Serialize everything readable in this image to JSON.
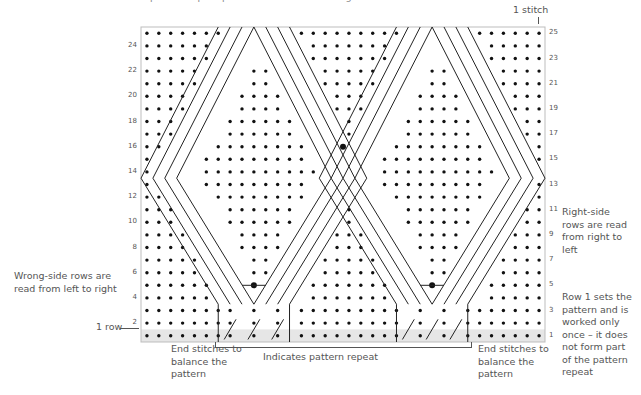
{
  "title_partial": "pattern repeat plus end stitches on the right of the chart",
  "labels": {
    "one_stitch": "1 stitch",
    "one_row": "1 row",
    "wrong_side": "Wrong-side rows are read from left to right",
    "right_side": "Right-side rows are read from right to left",
    "row1_note": "Row 1 sets the pattern and is worked only once – it does not form part of the pattern repeat",
    "end_left": "End stitches to balance the pattern",
    "end_right": "End stitches to balance the pattern",
    "repeat": "Indicates pattern repeat"
  },
  "chart": {
    "rows": 25,
    "cols": 34,
    "left_row_numbers": [
      "24",
      "22",
      "20",
      "18",
      "16",
      "14",
      "12",
      "10",
      "8",
      "6",
      "4",
      "2"
    ],
    "right_row_numbers": [
      "25",
      "23",
      "21",
      "19",
      "17",
      "15",
      "13",
      "11",
      "9",
      "7",
      "5",
      "3",
      "1"
    ],
    "colors": {
      "dot": "#111111",
      "line": "#222222",
      "row1_band": "#e6e6e6",
      "border": "#bdbdbd"
    }
  }
}
